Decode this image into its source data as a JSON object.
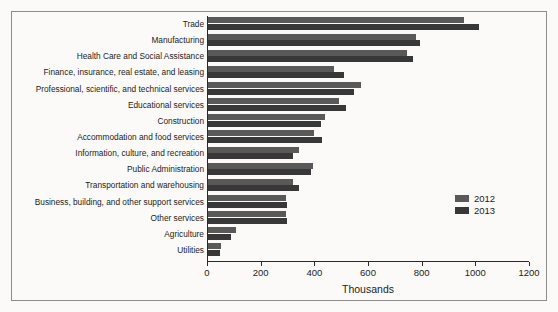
{
  "chart_data": {
    "type": "bar",
    "orientation": "horizontal",
    "title": "",
    "xlabel": "Thousands",
    "ylabel": "",
    "xlim": [
      0,
      1200
    ],
    "xticks": [
      0,
      200,
      400,
      600,
      800,
      1000,
      1200
    ],
    "grid": false,
    "legend_position": "right-middle",
    "categories": [
      "Trade",
      "Manufacturing",
      "Health Care and Social Assistance",
      "Finance, insurance, real estate, and leasing",
      "Professional, scientific, and technical services",
      "Educational services",
      "Construction",
      "Accommodation and food services",
      "Information, culture, and recreation",
      "Public Administration",
      "Transportation and warehousing",
      "Business, building, and other support services",
      "Other services",
      "Agriculture",
      "Utilities"
    ],
    "series": [
      {
        "name": "2012",
        "color": "#595959",
        "values": [
          955,
          775,
          740,
          470,
          570,
          490,
          435,
          395,
          340,
          390,
          315,
          290,
          290,
          105,
          50
        ]
      },
      {
        "name": "2013",
        "color": "#383838",
        "values": [
          1010,
          790,
          765,
          505,
          545,
          515,
          420,
          425,
          315,
          385,
          340,
          295,
          295,
          85,
          45
        ]
      }
    ]
  }
}
